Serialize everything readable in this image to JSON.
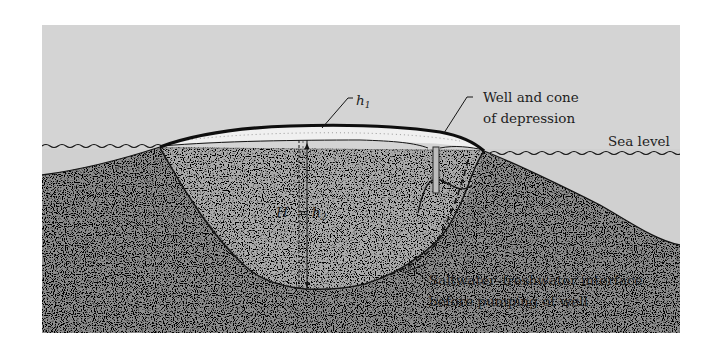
{
  "figure": {
    "type": "cross-section diagram",
    "colors": {
      "sky": "#d4d4d4",
      "saltwater_ground": "#8c8c8c",
      "freshwater_lens": "#a8a8a8",
      "unsaturated_zone": "#eeeeee",
      "outline": "#141414",
      "background": "#ffffff"
    }
  },
  "labels": {
    "h1": "h",
    "h1_sub": "1",
    "well": {
      "line1": "Well and cone",
      "line2": "of depression"
    },
    "sea_level": "Sea level",
    "H": "H",
    "equals": "=",
    "h2": "h",
    "h2_sub": "2",
    "interface": {
      "line1": "Saltwater–freshwater interface",
      "line2": "before pumping of well"
    }
  }
}
